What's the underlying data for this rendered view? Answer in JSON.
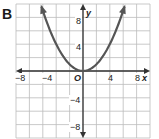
{
  "panel": {
    "label": "B"
  },
  "chart_data": {
    "type": "line",
    "title": "",
    "panel_label": "B",
    "xlabel": "x",
    "ylabel": "y",
    "xlim": [
      -10,
      10
    ],
    "ylim": [
      -10,
      10
    ],
    "grid": true,
    "grid_step": 2,
    "x_tick_labels": [
      "-8",
      "-4",
      "4",
      "8"
    ],
    "y_tick_labels": [
      "8",
      "4",
      "-4",
      "-8"
    ],
    "origin_label": "O",
    "series": [
      {
        "name": "y = x^2/4",
        "x": [
          -6.2,
          -6,
          -5,
          -4,
          -3,
          -2,
          -1,
          0,
          1,
          2,
          3,
          4,
          5,
          6,
          6.2
        ],
        "y": [
          9.61,
          9,
          6.25,
          4,
          2.25,
          1,
          0.25,
          0,
          0.25,
          1,
          2.25,
          4,
          6.25,
          9,
          9.61
        ],
        "arrows_at_ends": true
      }
    ],
    "colors": {
      "curve": "#555555",
      "axes": "#333333",
      "grid": "#bbbbbb"
    }
  },
  "labels": {
    "x_axis": "x",
    "y_axis": "y",
    "origin": "O",
    "xt_m8": "−8",
    "xt_m4": "−4",
    "xt_4": "4",
    "xt_8": "8",
    "yt_8": "8",
    "yt_4": "4",
    "yt_m4": "−4",
    "yt_m8": "−8"
  }
}
